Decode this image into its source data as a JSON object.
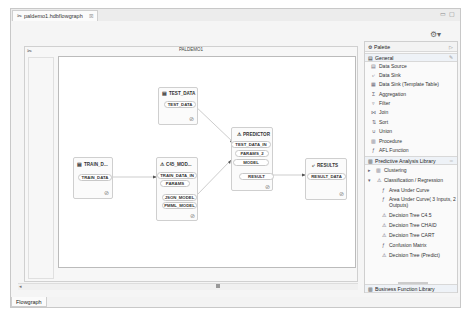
{
  "editor_tab": {
    "label": "paldemo1.hdbflowgraph",
    "close": "☒",
    "icon": "flowgraph-icon"
  },
  "window_controls": {
    "minimize": "▭",
    "maximize": "▢"
  },
  "toolbar": {
    "gear": "⚙▾"
  },
  "flowgraph": {
    "title": "PALDEMO1",
    "icon": "✂",
    "nodes": {
      "test_data": {
        "title": "TEST_DATA",
        "ports": [
          "TEST_DATA"
        ],
        "status": "⊘"
      },
      "train_data": {
        "title": "TRAIN_D...",
        "ports": [
          "TRAIN_DATA"
        ],
        "status": "⊘"
      },
      "c45": {
        "title": "C45_MOD...",
        "in_ports": [
          "TRAIN_DATA_IN",
          "PARAMS"
        ],
        "out_ports": [
          "JSON_MODEL",
          "PMML_MODEL"
        ],
        "status": "⊘"
      },
      "predictor": {
        "title": "PREDICTOR",
        "in_ports": [
          "TEST_DATA_IN",
          "PARAMS_2",
          "MODEL"
        ],
        "out_ports": [
          "RESULT"
        ],
        "status": "⊘"
      },
      "results": {
        "title": "RESULTS",
        "ports": [
          "RESULT_DATA"
        ],
        "status": "⊘"
      }
    }
  },
  "scrollbar": {
    "left_arrow": "◂",
    "thumb": "▪"
  },
  "bottom_tab": {
    "label": "Flowgraph"
  },
  "palette": {
    "title": "Palette",
    "collapse": "▷",
    "general": {
      "label": "General",
      "items": [
        {
          "label": "Data Source",
          "icon": "▤"
        },
        {
          "label": "Data Sink",
          "icon": "⤶"
        },
        {
          "label": "Data Sink (Template Table)",
          "icon": "▦"
        },
        {
          "label": "Aggregation",
          "icon": "Σ"
        },
        {
          "label": "Filter",
          "icon": "▿"
        },
        {
          "label": "Join",
          "icon": "⋈"
        },
        {
          "label": "Sort",
          "icon": "⇅"
        },
        {
          "label": "Union",
          "icon": "∪"
        },
        {
          "label": "Procedure",
          "icon": "▥"
        },
        {
          "label": "AFL Function",
          "icon": "ƒ"
        }
      ]
    },
    "pal": {
      "label": "Predictive Analysis Library",
      "groups": [
        {
          "label": "Clustering",
          "expanded": false,
          "toggle": "▸"
        },
        {
          "label": "Classification / Regression",
          "expanded": true,
          "toggle": "▾"
        }
      ],
      "items": [
        {
          "label": "Area Under Curve",
          "icon": "ƒ"
        },
        {
          "label": "Area Under Curve( 3 Inputs, 2 Outputs)",
          "icon": "ƒ"
        },
        {
          "label": "Decision Tree C4.5",
          "icon": "⚠"
        },
        {
          "label": "Decision Tree CHAID",
          "icon": "⚠"
        },
        {
          "label": "Decision Tree CART",
          "icon": "⚠"
        },
        {
          "label": "Confusion Matrix",
          "icon": "ƒ"
        },
        {
          "label": "Decision Tree (Predict)",
          "icon": "⚠"
        }
      ]
    },
    "business": {
      "label": "Business Function Library"
    }
  }
}
